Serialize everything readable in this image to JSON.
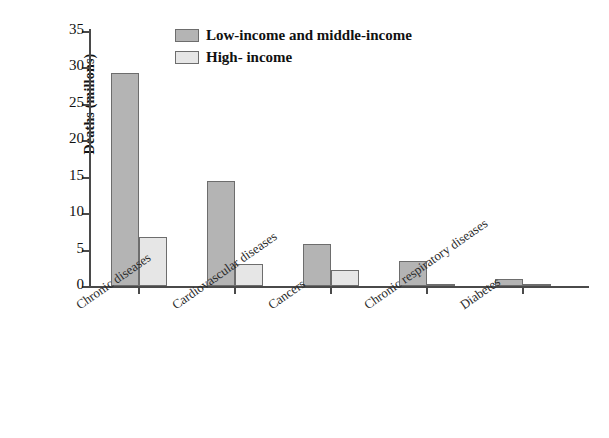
{
  "chart_data": {
    "type": "bar",
    "title": "",
    "subtitle": "",
    "xlabel": "",
    "ylabel": "Deaths (millons)",
    "ylim": [
      0,
      35
    ],
    "ytick_values": [
      0,
      5,
      10,
      15,
      20,
      25,
      30,
      35
    ],
    "ytick_labels": [
      "0",
      "5",
      "10",
      "15",
      "20",
      "25",
      "30",
      "35"
    ],
    "grid": false,
    "legend_position": "top-center",
    "categories": [
      "Chronic diseases",
      "Cardiovascular diseases",
      "Cancers",
      "Chronic respiratory diseases",
      "Diabetes"
    ],
    "series": [
      {
        "name": "Low-income and middle-income",
        "color": "#b4b4b4",
        "values": [
          29.3,
          14.4,
          5.7,
          3.5,
          1.0
        ]
      },
      {
        "name": "High- income",
        "color": "#e6e6e6",
        "values": [
          6.7,
          3.0,
          2.2,
          0.3,
          0.2
        ]
      }
    ]
  },
  "legend": {
    "items": [
      {
        "label": "Low-income and middle-income"
      },
      {
        "label": "High- income"
      }
    ]
  },
  "colors": {
    "series_low_middle": "#b4b4b4",
    "series_high": "#e6e6e6",
    "axis": "#4a4a4a",
    "bar_border": "#6d6d6d",
    "text": "#111111",
    "background": "#ffffff"
  }
}
